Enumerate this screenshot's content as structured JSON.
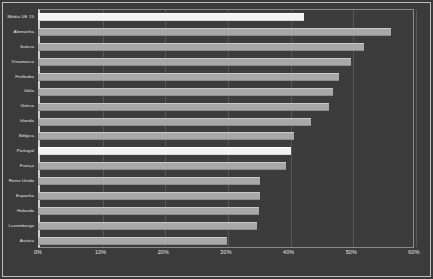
{
  "chart_data": {
    "type": "bar",
    "orientation": "horizontal",
    "title": "",
    "xlabel": "",
    "ylabel": "",
    "xlim": [
      0,
      60
    ],
    "xtick_labels": [
      "0%",
      "10%",
      "20%",
      "30%",
      "40%",
      "50%",
      "60%"
    ],
    "xticks": [
      0,
      10,
      20,
      30,
      40,
      50,
      60
    ],
    "grid": true,
    "legend": false,
    "categories": [
      "Média UE 15",
      "Alemanha",
      "Suécia",
      "Dinamarca",
      "Finlândia",
      "Itália",
      "Grécia",
      "Irlanda",
      "Bélgica",
      "Portugal",
      "França",
      "Reino Unido",
      "Espanha",
      "Holanda",
      "Luxemburgo",
      "Áustria"
    ],
    "values": [
      42.5,
      56.3,
      52.0,
      50.0,
      48.0,
      47.0,
      46.5,
      43.5,
      40.8,
      40.3,
      39.5,
      35.4,
      35.4,
      35.2,
      35.0,
      30.2
    ],
    "highlighted": [
      "Média UE 15",
      "Portugal"
    ],
    "colors": {
      "bar": "#a8a8a8",
      "bar_highlight": "#f2f2f2",
      "background": "#3c3c3c",
      "frame": "#bdbdbd",
      "axis": "#cfcfcf",
      "grid": "#575757",
      "text": "#e8e8e8"
    }
  }
}
